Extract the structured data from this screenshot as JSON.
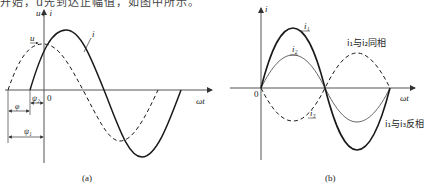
{
  "top_text": "开始，u先到达正幅值，如图中所示。",
  "panel_a": {
    "caption": "(a)",
    "y_axis_label": "u、i",
    "x_axis_label": "ωt",
    "origin_label": "0",
    "curve_labels": {
      "current": "i",
      "voltage": "u"
    },
    "phase_labels": {
      "phi": "φ",
      "psi1": "ψ₁",
      "psi2": "ψ₂"
    }
  },
  "panel_b": {
    "caption": "(b)",
    "y_axis_label": "i",
    "x_axis_label": "ωt",
    "origin_label": "0",
    "curve_labels": {
      "i1": "i₁",
      "i2": "i₂",
      "i3": "i₃"
    },
    "annotations": {
      "in_phase": "i₁与i₂同相",
      "anti_phase": "i₁与i₃反相"
    }
  },
  "colors": {
    "line": "#1a1a1a",
    "thin_line": "#666666",
    "axis": "#555555"
  }
}
